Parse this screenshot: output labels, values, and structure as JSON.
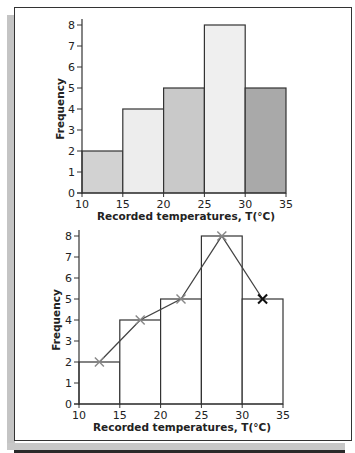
{
  "chart_data": [
    {
      "type": "bar",
      "subtype": "histogram",
      "categories": [
        "10-15",
        "15-20",
        "20-25",
        "25-30",
        "30-35"
      ],
      "bin_edges": [
        10,
        15,
        20,
        25,
        30,
        35
      ],
      "values": [
        2,
        4,
        5,
        8,
        5
      ],
      "bar_colors": [
        "#d2d2d2",
        "#ededed",
        "#c9c9c9",
        "#efefef",
        "#a9a9a9"
      ],
      "title": "",
      "xlabel": "Recorded temperatures, T(°C)",
      "ylabel": "Frequency",
      "xticks": [
        10,
        15,
        20,
        25,
        30,
        35
      ],
      "yticks": [
        0,
        1,
        2,
        3,
        4,
        5,
        6,
        7,
        8
      ],
      "xlim": [
        10,
        35
      ],
      "ylim": [
        0,
        8
      ],
      "grid": false,
      "legend": null
    },
    {
      "type": "bar",
      "subtype": "histogram-with-frequency-polygon",
      "categories": [
        "10-15",
        "15-20",
        "20-25",
        "25-30",
        "30-35"
      ],
      "bin_edges": [
        10,
        15,
        20,
        25,
        30,
        35
      ],
      "values": [
        2,
        4,
        5,
        8,
        5
      ],
      "bar_fill": "#ffffff",
      "series": [
        {
          "name": "Frequency polygon",
          "type": "line",
          "marker": "x",
          "x": [
            12.5,
            17.5,
            22.5,
            27.5,
            32.5
          ],
          "values": [
            2,
            4,
            5,
            8,
            5
          ]
        }
      ],
      "title": "",
      "xlabel": "Recorded temperatures, T(°C)",
      "ylabel": "Frequency",
      "xticks": [
        10,
        15,
        20,
        25,
        30,
        35
      ],
      "yticks": [
        0,
        1,
        2,
        3,
        4,
        5,
        6,
        7,
        8
      ],
      "xlim": [
        10,
        35
      ],
      "ylim": [
        0,
        8
      ],
      "grid": false,
      "legend": null
    }
  ],
  "top_chart": {
    "ylabel": "Frequency",
    "xlabel": "Recorded temperatures, T(°C)",
    "xtick_labels": [
      "10",
      "15",
      "20",
      "25",
      "30",
      "35"
    ],
    "ytick_labels": [
      "0",
      "1",
      "2",
      "3",
      "4",
      "5",
      "6",
      "7",
      "8"
    ]
  },
  "bottom_chart": {
    "ylabel": "Frequency",
    "xlabel": "Recorded temperatures, T(°C)",
    "xtick_labels": [
      "10",
      "15",
      "20",
      "25",
      "30",
      "35"
    ],
    "ytick_labels": [
      "0",
      "1",
      "2",
      "3",
      "4",
      "5",
      "6",
      "7",
      "8"
    ]
  },
  "colors": {
    "axis": "#333333",
    "bar_stroke": "#333333",
    "polygon_line": "#444444",
    "marker_light": "#888888",
    "marker_dark": "#111111",
    "frame_shadow": "#c4c4c4"
  }
}
